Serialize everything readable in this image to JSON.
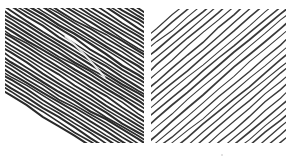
{
  "image": {
    "description": "Two square hand-drawn hatching samples side by side",
    "background": "#ffffff",
    "panels": [
      {
        "id": "left",
        "label": "dense-hatching",
        "line_color": "#2a2a2a",
        "line_count": 44,
        "direction": "down-right",
        "stroke_width": 1.9,
        "highlight_streak": true
      },
      {
        "id": "right",
        "label": "sparse-hatching",
        "line_color": "#3a3a3a",
        "line_count": 30,
        "direction": "up-right",
        "stroke_width": 1.4,
        "highlight_streak": false
      }
    ]
  }
}
